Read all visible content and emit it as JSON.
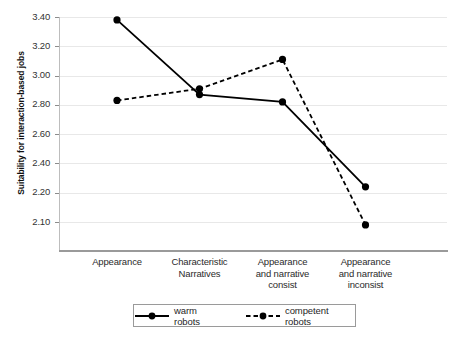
{
  "chart_data": {
    "type": "line",
    "title": "",
    "xlabel": "",
    "ylabel": "Suitability for interaction-based jobs",
    "categories": [
      "Appearance",
      "Characteristic Narratives",
      "Appearance and narrative consist",
      "Appearance and narrative inconsist"
    ],
    "category_lines": [
      [
        "Appearance"
      ],
      [
        "Characteristic",
        "Narratives"
      ],
      [
        "Appearance",
        "and narrative",
        "consist"
      ],
      [
        "Appearance",
        "and narrative",
        "inconsist"
      ]
    ],
    "series": [
      {
        "name": "warm robots",
        "style": "solid",
        "marker": "circle",
        "values": [
          3.38,
          2.87,
          2.82,
          2.24
        ]
      },
      {
        "name": "competent robots",
        "style": "dashed",
        "marker": "circle",
        "values": [
          2.83,
          2.91,
          3.11,
          2.09
        ]
      }
    ],
    "ytick_labels": [
      "3.40",
      "3.20",
      "3.00",
      "2.80",
      "2.60",
      "2.40",
      "2.20",
      "2.10"
    ],
    "ytick_values": [
      3.4,
      3.2,
      3.0,
      2.8,
      2.6,
      2.4,
      2.2,
      2.1
    ],
    "ylim": [
      2.0,
      3.4
    ],
    "grid": true,
    "grid_axis": "y",
    "legend_position": "bottom",
    "line_color": "#000000",
    "grid_color": "#e8e8e8",
    "axis_color": "#9a9a9a",
    "background": "#ffffff"
  },
  "legend": {
    "entries": [
      {
        "label": "warm robots",
        "style": "solid"
      },
      {
        "label": "competent robots",
        "style": "dashed"
      }
    ]
  }
}
